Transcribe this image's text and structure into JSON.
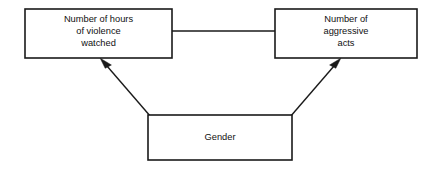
{
  "diagram": {
    "type": "path-model",
    "background_color": "#ffffff",
    "line_color": "#1a1a1a",
    "text_color": "#111111",
    "nodes": [
      {
        "id": "hours_violence",
        "name": "hours-of-violence-box",
        "lines": [
          "Number of hours",
          "of violence",
          "watched"
        ],
        "x": 25,
        "y": 9,
        "width": 147,
        "height": 49
      },
      {
        "id": "aggressive_acts",
        "name": "aggressive-acts-box",
        "lines": [
          "Number of",
          "aggressive",
          "acts"
        ],
        "x": 275,
        "y": 9,
        "width": 142,
        "height": 49
      },
      {
        "id": "gender",
        "name": "gender-box",
        "lines": [
          "Gender"
        ],
        "x": 148,
        "y": 115,
        "width": 144,
        "height": 45
      }
    ],
    "connectors": [
      {
        "id": "hours_to_acts",
        "name": "connector-hours-to-acts",
        "style": "plain-line",
        "from": "hours_violence",
        "to": "aggressive_acts",
        "x1": 172,
        "y1": 31,
        "x2": 275,
        "y2": 31
      },
      {
        "id": "gender_to_hours",
        "name": "arrow-gender-to-hours",
        "style": "arrow",
        "from": "gender",
        "to": "hours_violence",
        "x1": 151,
        "y1": 117,
        "x2": 101,
        "y2": 59
      },
      {
        "id": "gender_to_acts",
        "name": "arrow-gender-to-acts",
        "style": "arrow",
        "from": "gender",
        "to": "aggressive_acts",
        "x1": 290,
        "y1": 117,
        "x2": 340,
        "y2": 59
      }
    ]
  }
}
